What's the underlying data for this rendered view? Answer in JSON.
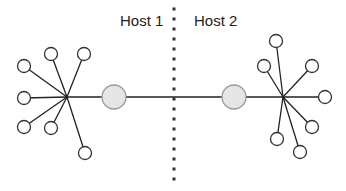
{
  "labels": {
    "host1": "Host 1",
    "host2": "Host 2"
  },
  "colors": {
    "line": "#222222",
    "node_fill": "#ffffff",
    "node_stroke": "#333333",
    "gateway_fill": "#e6e6e6",
    "gateway_stroke": "#999999",
    "divider": "#333333"
  },
  "hosts": [
    {
      "name": "Host 1",
      "hub": [
        67,
        97
      ],
      "gateway": [
        114,
        97
      ],
      "nodes": [
        [
          24,
          66
        ],
        [
          51,
          54
        ],
        [
          84,
          54
        ],
        [
          24,
          98
        ],
        [
          24,
          127
        ],
        [
          51,
          128
        ],
        [
          85,
          153
        ]
      ]
    },
    {
      "name": "Host 2",
      "hub": [
        283,
        97
      ],
      "gateway": [
        234,
        97
      ],
      "nodes": [
        [
          276,
          41
        ],
        [
          264,
          66
        ],
        [
          312,
          66
        ],
        [
          325,
          97
        ],
        [
          312,
          127
        ],
        [
          277,
          139
        ],
        [
          300,
          152
        ]
      ]
    }
  ],
  "divider": {
    "x": 174,
    "y1": 9,
    "y2": 185
  }
}
